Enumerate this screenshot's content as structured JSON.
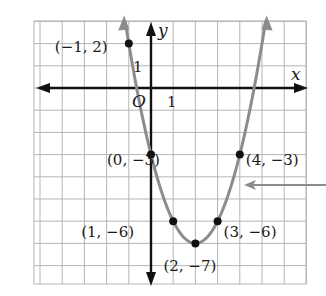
{
  "chart_data": {
    "type": "line",
    "title": "",
    "xlabel": "x",
    "ylabel": "y",
    "origin_label": "O",
    "tick_labels": {
      "x": "1",
      "y": "1"
    },
    "xlim": [
      -5,
      7
    ],
    "ylim": [
      -9,
      3
    ],
    "grid": true,
    "function": "y = x^2 - 4x - 3",
    "series": [
      {
        "name": "parabola",
        "color": "#8c8c8c",
        "points": [
          {
            "x": -1,
            "y": 2,
            "label": "(−1, 2)"
          },
          {
            "x": 0,
            "y": -3,
            "label": "(0, −3)"
          },
          {
            "x": 1,
            "y": -6,
            "label": "(1, −6)"
          },
          {
            "x": 2,
            "y": -7,
            "label": "(2, −7)"
          },
          {
            "x": 3,
            "y": -6,
            "label": "(3, −6)"
          },
          {
            "x": 4,
            "y": -3,
            "label": "(4, −3)"
          }
        ]
      }
    ],
    "annotations": [
      {
        "type": "arrow",
        "pointing_to": "curve",
        "color": "#8c8c8c",
        "from_side": "right",
        "y": -4.5
      }
    ]
  },
  "colors": {
    "grid": "#b5b5b5",
    "axes": "#111111",
    "curve": "#8c8c8c",
    "point": "#111111"
  }
}
